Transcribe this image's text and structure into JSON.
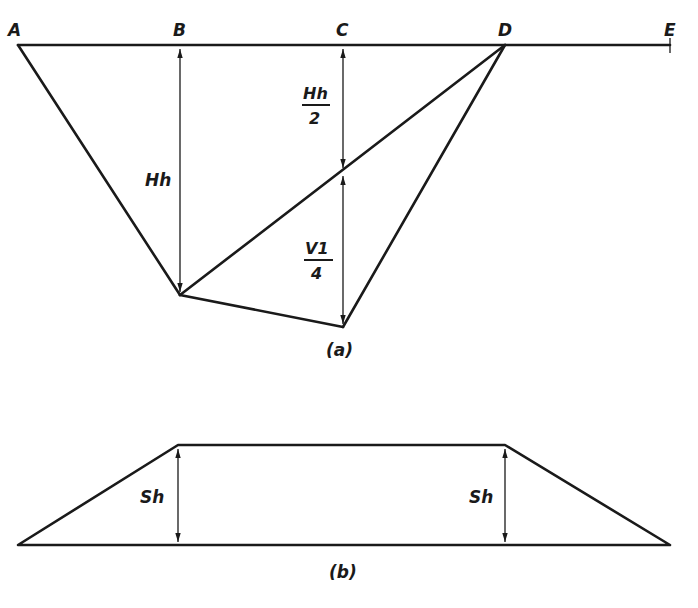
{
  "figure_a": {
    "caption": "(a)",
    "points": {
      "A": "A",
      "B": "B",
      "C": "C",
      "D": "D",
      "E": "E"
    },
    "dimensions": {
      "hh": "Hh",
      "hh_half_num": "Hh",
      "hh_half_den": "2",
      "v1_quarter_num": "V1",
      "v1_quarter_den": "4"
    }
  },
  "figure_b": {
    "caption": "(b)",
    "dimensions": {
      "sh_left": "Sh",
      "sh_right": "Sh"
    }
  },
  "colors": {
    "ink": "#1a1a1a",
    "paper": "#ffffff"
  }
}
